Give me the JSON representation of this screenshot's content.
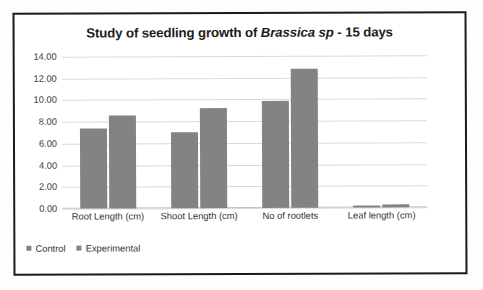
{
  "chart_data": {
    "type": "bar",
    "title": "Study of seedling growth of Brassica sp - 15 days",
    "title_parts": {
      "before": "Study of seedling growth of ",
      "italic": "Brassica sp",
      "after": " - 15 days"
    },
    "categories": [
      "Root Length (cm)",
      "Shoot Length (cm)",
      "No of rootlets",
      "Leaf length (cm)"
    ],
    "series": [
      {
        "name": "Control",
        "values": [
          7.4,
          7.0,
          9.85,
          0.2
        ],
        "color": "#838383"
      },
      {
        "name": "Experimental",
        "values": [
          8.6,
          9.2,
          12.8,
          0.25
        ],
        "color": "#838383"
      }
    ],
    "xlabel": "",
    "ylabel": "",
    "ylim": [
      0,
      14
    ],
    "ytick_step": 2,
    "ytick_labels": [
      "14.00",
      "12.00",
      "10.00",
      "8.00",
      "6.00",
      "4.00",
      "2.00",
      "0.00"
    ],
    "ytick_values": [
      14,
      12,
      10,
      8,
      6,
      4,
      2,
      0
    ],
    "grid": true,
    "legend_position": "bottom-left"
  },
  "legend": {
    "items": [
      {
        "label": "Control",
        "marker": "square-marker"
      },
      {
        "label": "Experimental",
        "marker": "square-marker"
      }
    ]
  },
  "colors": {
    "bar": "#838383",
    "gridline": "#d9d9d9",
    "text": "#333333",
    "title": "#1c1c1c",
    "frame_border": "#1a1a1a",
    "background": "#ffffff"
  }
}
